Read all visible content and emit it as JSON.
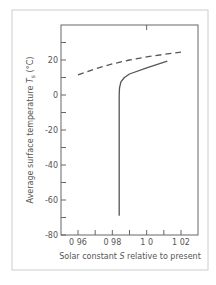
{
  "chart_data": {
    "type": "line",
    "title": "",
    "xlabel": "Solar constant S relative to present",
    "xlabel_parts": {
      "pre": "Solar constant ",
      "var": "S",
      "post": " relative to present"
    },
    "ylabel": "Average surface temperature Ts (°C)",
    "ylabel_parts": {
      "pre": "Average surface temperature ",
      "var": "T",
      "sub": "s",
      "post": " (°C)"
    },
    "xlim": [
      0.95,
      1.03
    ],
    "ylim": [
      -80,
      40
    ],
    "x_ticks": [
      0.96,
      0.97,
      0.98,
      0.99,
      1.0,
      1.01,
      1.02
    ],
    "x_tick_labels": [
      "0 96",
      "",
      "0 98",
      "",
      "1 0",
      "",
      "1 02"
    ],
    "y_ticks_major": [
      -80,
      -60,
      -40,
      -20,
      0,
      20
    ],
    "y_tick_labels": [
      "-80",
      "-60",
      "-40",
      "-20",
      "0",
      "20"
    ],
    "y_ticks_minor": [
      -70,
      -50,
      -30,
      -10,
      10,
      30
    ],
    "grid": false,
    "legend": null,
    "series": [
      {
        "name": "dashed",
        "style": "dashed",
        "points": [
          [
            0.96,
            11.5
          ],
          [
            0.97,
            15.0
          ],
          [
            0.98,
            17.8
          ],
          [
            0.99,
            20.0
          ],
          [
            1.0,
            21.8
          ],
          [
            1.01,
            23.2
          ],
          [
            1.02,
            24.5
          ]
        ]
      },
      {
        "name": "solid",
        "style": "solid",
        "points": [
          [
            0.984,
            -69
          ],
          [
            0.984,
            -40
          ],
          [
            0.984,
            0
          ],
          [
            0.9842,
            4
          ],
          [
            0.985,
            7.5
          ],
          [
            0.987,
            10
          ],
          [
            0.99,
            12
          ],
          [
            1.0,
            15.5
          ],
          [
            1.012,
            19.3
          ]
        ]
      }
    ]
  },
  "colors": {
    "line": "#555555",
    "frame": "#666666",
    "border": "#cccccc"
  }
}
